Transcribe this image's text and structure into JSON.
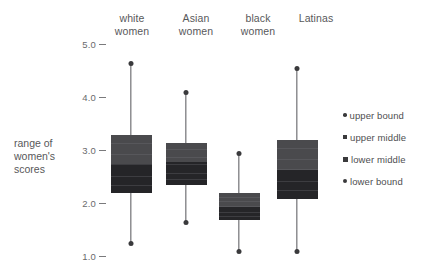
{
  "chart_data": {
    "type": "bar",
    "chart_kind": "range-bar / box-style distribution chart",
    "title": "",
    "subtitle": "",
    "xlabel": "",
    "ylabel": "range of women's scores",
    "ylim": [
      1.0,
      5.0
    ],
    "ytick_labels": [
      "5.0",
      "4.0",
      "3.0",
      "2.0",
      "1.0"
    ],
    "ytick_values": [
      5.0,
      4.0,
      3.0,
      2.0,
      1.0
    ],
    "grid": false,
    "legend_position": "right",
    "categories": [
      "white women",
      "Asian women",
      "black women",
      "Latinas"
    ],
    "series": [
      {
        "name": "upper bound",
        "values": [
          4.65,
          4.1,
          2.95,
          4.55
        ]
      },
      {
        "name": "upper middle",
        "values": [
          3.3,
          3.15,
          2.2,
          3.2
        ]
      },
      {
        "name": "lower middle",
        "values": [
          2.2,
          2.35,
          1.7,
          2.1
        ]
      },
      {
        "name": "lower bound",
        "values": [
          1.25,
          1.65,
          1.1,
          1.1
        ]
      }
    ],
    "median": [
      2.75,
      2.8,
      1.95,
      2.65
    ],
    "colors": {
      "box_upper": "#4a4a4d",
      "box_lower": "#252528",
      "whisker": "#55555a",
      "dot": "#3a3a3c",
      "text": "#58585a",
      "background": "#ffffff"
    }
  },
  "axis": {
    "title": "range of\nwomen's\nscores",
    "ticks": [
      {
        "label": "5.0",
        "value": 5.0
      },
      {
        "label": "4.0",
        "value": 4.0
      },
      {
        "label": "3.0",
        "value": 3.0
      },
      {
        "label": "2.0",
        "value": 2.0
      },
      {
        "label": "1.0",
        "value": 1.0
      }
    ]
  },
  "columns": [
    {
      "label": "white\nwomen",
      "key": "white-women"
    },
    {
      "label": "Asian\nwomen",
      "key": "asian-women"
    },
    {
      "label": "black\nwomen",
      "key": "black-women"
    },
    {
      "label": "Latinas",
      "key": "latinas"
    }
  ],
  "legend": {
    "items": [
      {
        "label": "upper bound",
        "marker": "dot-small"
      },
      {
        "label": "upper middle",
        "marker": "square-small"
      },
      {
        "label": "lower middle",
        "marker": "square-medium"
      },
      {
        "label": "lower bound",
        "marker": "dot-medium"
      }
    ]
  }
}
